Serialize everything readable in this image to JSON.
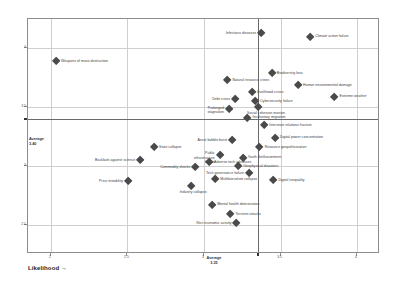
{
  "axes": {
    "x_title": "Likelihood →",
    "y_title": "Impact →",
    "x_ticks": [
      "2",
      "2.5",
      "3",
      "3.5",
      "4"
    ],
    "y_ticks": [
      "2.5",
      "3",
      "3.5",
      "4"
    ],
    "x_average_label": "Average",
    "x_average_value": "3.35",
    "y_average_label": "Average",
    "y_average_value": "3.40",
    "xlim": [
      1.85,
      4.15
    ],
    "ylim": [
      2.25,
      4.25
    ]
  },
  "chart_data": {
    "type": "scatter",
    "title": "",
    "xlabel": "Likelihood →",
    "ylabel": "Impact →",
    "xlim": [
      1.85,
      4.15
    ],
    "ylim": [
      2.25,
      4.25
    ],
    "grid": true,
    "legend": "none",
    "x_average": 3.35,
    "y_average": 3.4,
    "points": [
      {
        "label": "Weapons of mass destruction",
        "x": 2.04,
        "y": 3.88,
        "side": "right"
      },
      {
        "label": "Infectious diseases",
        "x": 3.38,
        "y": 4.12,
        "side": "left"
      },
      {
        "label": "Climate action failure",
        "x": 3.7,
        "y": 4.09,
        "side": "right"
      },
      {
        "label": "Biodiversity loss",
        "x": 3.45,
        "y": 3.78,
        "side": "right"
      },
      {
        "label": "Human environmental damage",
        "x": 3.62,
        "y": 3.68,
        "side": "right"
      },
      {
        "label": "Natural resource crises",
        "x": 3.16,
        "y": 3.72,
        "side": "right"
      },
      {
        "label": "Livelihood crises",
        "x": 3.32,
        "y": 3.62,
        "side": "right"
      },
      {
        "label": "Extreme weather",
        "x": 3.86,
        "y": 3.58,
        "side": "right"
      },
      {
        "label": "Cybersecurity failure",
        "x": 3.34,
        "y": 3.54,
        "side": "right"
      },
      {
        "label": "Debt crises",
        "x": 3.21,
        "y": 3.56,
        "side": "left"
      },
      {
        "label": "Social cohesion erosion",
        "x": 3.36,
        "y": 3.49,
        "side": "below"
      },
      {
        "label": "Prolonged stagnation",
        "x": 3.17,
        "y": 3.47,
        "side": "below"
      },
      {
        "label": "Involuntary migration",
        "x": 3.29,
        "y": 3.4,
        "side": "right"
      },
      {
        "label": "Interstate relations fracture",
        "x": 3.4,
        "y": 3.34,
        "side": "right"
      },
      {
        "label": "Digital power concentration",
        "x": 3.47,
        "y": 3.23,
        "side": "right"
      },
      {
        "label": "Asset bubble burst",
        "x": 3.19,
        "y": 3.21,
        "side": "left"
      },
      {
        "label": "Resource geopoliticization",
        "x": 3.37,
        "y": 3.15,
        "side": "right"
      },
      {
        "label": "State collapse",
        "x": 2.68,
        "y": 3.15,
        "side": "right"
      },
      {
        "label": "Public infrastructure failure",
        "x": 3.11,
        "y": 3.08,
        "side": "left"
      },
      {
        "label": "Youth disillusionment",
        "x": 3.26,
        "y": 3.06,
        "side": "right"
      },
      {
        "label": "Geophysical disasters",
        "x": 3.23,
        "y": 2.99,
        "side": "right"
      },
      {
        "label": "Backlash against science",
        "x": 2.59,
        "y": 3.04,
        "side": "left"
      },
      {
        "label": "Adverse tech advances",
        "x": 3.04,
        "y": 3.02,
        "side": "right"
      },
      {
        "label": "Commodity shocks",
        "x": 2.95,
        "y": 2.98,
        "side": "left"
      },
      {
        "label": "Tech governance failure",
        "x": 3.3,
        "y": 2.93,
        "side": "left"
      },
      {
        "label": "Digital inequality",
        "x": 3.46,
        "y": 2.87,
        "side": "right"
      },
      {
        "label": "Multilateralism collapse",
        "x": 3.08,
        "y": 2.88,
        "side": "right"
      },
      {
        "label": "Price instability",
        "x": 2.51,
        "y": 2.86,
        "side": "left"
      },
      {
        "label": "Industry collapse",
        "x": 2.92,
        "y": 2.82,
        "side": "below"
      },
      {
        "label": "Mental health deterioration",
        "x": 3.06,
        "y": 2.66,
        "side": "right"
      },
      {
        "label": "Terrorist attacks",
        "x": 3.18,
        "y": 2.58,
        "side": "right"
      },
      {
        "label": "Illicit economic activity",
        "x": 3.22,
        "y": 2.5,
        "side": "left"
      }
    ]
  }
}
